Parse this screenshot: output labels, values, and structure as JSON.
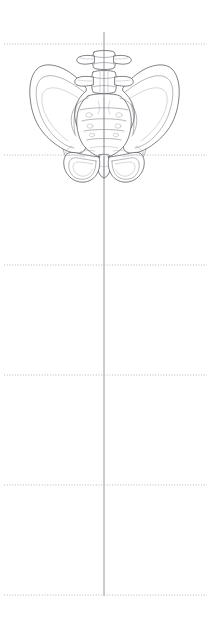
{
  "figure": {
    "view": "anterior",
    "canvas": {
      "width": 213,
      "height": 629
    },
    "background_color": "#ffffff"
  },
  "colors": {
    "background": "#ffffff",
    "bone_outline": "#4a4a52",
    "bone_inner": "#70707a",
    "bone_faint": "#9a9aa4",
    "bone_shade": "#f4f4f6",
    "guide_dotted": "#b0b0b8",
    "guide_vertical": "#8c8c94"
  },
  "guides": {
    "vertical_line": {
      "name": "plumb-line",
      "x": 104,
      "y_start": 32,
      "y_end": 596,
      "color": "#8c8c94",
      "style": "solid"
    },
    "horizontal_lines": [
      {
        "index": 1,
        "y": 44,
        "x_start": 4,
        "x_end": 207,
        "style": "dotted"
      },
      {
        "index": 2,
        "y": 155,
        "x_start": 4,
        "x_end": 207,
        "style": "dotted"
      },
      {
        "index": 3,
        "y": 265,
        "x_start": 4,
        "x_end": 207,
        "style": "dotted"
      },
      {
        "index": 4,
        "y": 375,
        "x_start": 4,
        "x_end": 207,
        "style": "dotted"
      },
      {
        "index": 5,
        "y": 485,
        "x_start": 4,
        "x_end": 207,
        "style": "dotted"
      },
      {
        "index": 6,
        "y": 595,
        "x_start": 4,
        "x_end": 207,
        "style": "dotted"
      }
    ],
    "spacing_px": 110,
    "count": 6
  },
  "anatomy": {
    "structures": [
      {
        "name": "lumbar-vertebra-upper",
        "label": "Lumbar vertebra (upper)"
      },
      {
        "name": "lumbar-vertebra-lower",
        "label": "Lumbar vertebra (lower)"
      },
      {
        "name": "sacrum",
        "label": "Sacrum"
      },
      {
        "name": "coccyx",
        "label": "Coccyx"
      },
      {
        "name": "ilium-left",
        "label": "Left ilium"
      },
      {
        "name": "ilium-right",
        "label": "Right ilium"
      },
      {
        "name": "obturator-foramen-left",
        "label": "Left obturator foramen"
      },
      {
        "name": "obturator-foramen-right",
        "label": "Right obturator foramen"
      },
      {
        "name": "pubic-symphysis",
        "label": "Pubic symphysis"
      },
      {
        "name": "ischium-left",
        "label": "Left ischium"
      },
      {
        "name": "ischium-right",
        "label": "Right ischium"
      }
    ],
    "bounds": {
      "x_min": 28,
      "x_max": 181,
      "y_min": 52,
      "y_max": 182
    }
  }
}
